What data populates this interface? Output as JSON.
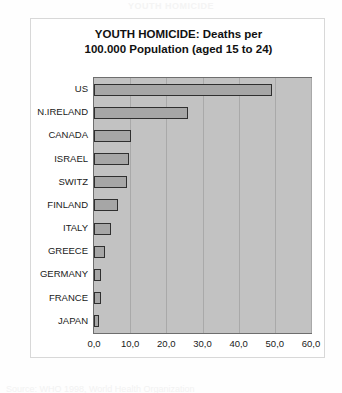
{
  "card": {
    "title_line1": "YOUTH HOMICIDE: Deaths per",
    "title_line2": "100.000 Population (aged 15 to 24)"
  },
  "top_clipped_text": "YOUTH HOMICIDE",
  "bottom_clipped_text": "Source: WHO 1998, World Health Organization",
  "colors": {
    "plot_background": "#c2c2c2",
    "bar_fill": "#a6a6a6",
    "bar_stroke": "#2f2f2f",
    "gridline": "#a9a9a9",
    "plot_border": "#6e6e6e",
    "card_background": "#ffffff",
    "text": "#1a1a1a"
  },
  "chart_data": {
    "type": "bar",
    "orientation": "horizontal",
    "title": "YOUTH HOMICIDE: Deaths per 100.000 Population (aged 15 to 24)",
    "xlabel": "",
    "ylabel": "",
    "categories": [
      "US",
      "N.IRELAND",
      "CANADA",
      "ISRAEL",
      "SWITZ",
      "FINLAND",
      "ITALY",
      "GREECE",
      "GERMANY",
      "FRANCE",
      "JAPAN"
    ],
    "values": [
      49.2,
      26.0,
      10.2,
      9.6,
      9.0,
      6.5,
      4.8,
      3.0,
      2.0,
      2.0,
      1.5
    ],
    "xlim": [
      0,
      60
    ],
    "xticks": [
      0,
      10,
      20,
      30,
      40,
      50,
      60
    ],
    "xtick_labels": [
      "0,0",
      "10,0",
      "20,0",
      "30,0",
      "40,0",
      "50,0",
      "60,0"
    ],
    "grid": true,
    "legend": false
  }
}
